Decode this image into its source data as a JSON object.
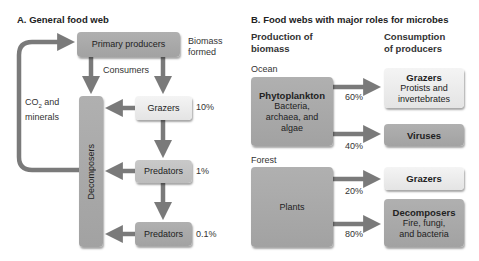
{
  "panel_a": {
    "title": "A. General food web",
    "primary_producers": "Primary producers",
    "biomass_label_1": "Biomass",
    "biomass_label_2": "formed",
    "consumers_label": "Consumers",
    "co2_label_1": "CO",
    "co2_sub": "2",
    "co2_label_1b": " and",
    "co2_label_2": "minerals",
    "decomposers": "Decomposers",
    "grazers": "Grazers",
    "grazers_pct": "10%",
    "predators_1": "Predators",
    "predators_1_pct": "1%",
    "predators_2": "Predators",
    "predators_2_pct": "0.1%"
  },
  "panel_b": {
    "title": "B. Food webs with major roles for microbes",
    "col_production_1": "Production of",
    "col_production_2": "biomass",
    "col_consumption_1": "Consumption",
    "col_consumption_2": "of producers",
    "ocean": {
      "label": "Ocean",
      "producer_title": "Phytoplankton",
      "producer_desc_1": "Bacteria,",
      "producer_desc_2": "archaea, and",
      "producer_desc_3": "algae",
      "grazers_title": "Grazers",
      "grazers_desc_1": "Protists and",
      "grazers_desc_2": "invertebrates",
      "grazers_pct": "60%",
      "viruses_title": "Viruses",
      "viruses_pct": "40%"
    },
    "forest": {
      "label": "Forest",
      "producer_title": "Plants",
      "grazers_title": "Grazers",
      "grazers_pct": "20%",
      "decomposers_title": "Decomposers",
      "decomposers_desc_1": "Fire, fungi,",
      "decomposers_desc_2": "and bacteria",
      "decomposers_pct": "80%"
    }
  },
  "colors": {
    "arrow": "#7a7a7a",
    "dark_box": "#a8a8a8",
    "mid_box": "#c2c2c2",
    "light_box": "#ececec"
  }
}
